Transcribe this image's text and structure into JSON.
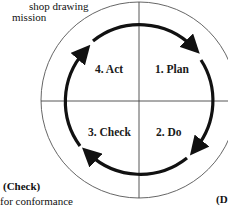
{
  "fragments": {
    "top_left_line1": "shop drawing",
    "top_left_line2": "mission",
    "bottom_left_heading": "(Check)",
    "bottom_left_text": "for conformance",
    "bottom_right_heading": "(D"
  },
  "cycle": {
    "quadrants": [
      {
        "id": "plan",
        "label": "1. Plan"
      },
      {
        "id": "do",
        "label": "2. Do"
      },
      {
        "id": "check",
        "label": "3. Check"
      },
      {
        "id": "act",
        "label": "4. Act"
      }
    ],
    "direction": "clockwise"
  },
  "colors": {
    "line": "#333333",
    "arrow": "#111111",
    "text": "#111111"
  }
}
